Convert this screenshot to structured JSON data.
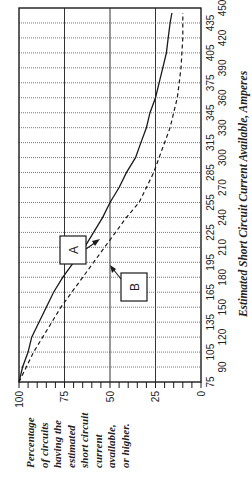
{
  "chart_data": {
    "type": "line",
    "title": "",
    "xlabel": "Estimated Short Circuit Current Available, Amperes",
    "ylabel": "Percentage of circuits having the estimated short circuit current available, or higher.",
    "ylabel_lines": [
      "Percentage",
      "of circuits",
      "having the",
      "estimated",
      "short circuit",
      "current",
      "available,",
      "or higher."
    ],
    "x": [
      75,
      90,
      105,
      120,
      135,
      150,
      165,
      180,
      195,
      210,
      225,
      240,
      255,
      270,
      285,
      300,
      315,
      330,
      345,
      360,
      375,
      390,
      405,
      420,
      435,
      445
    ],
    "xticks": [
      75,
      90,
      105,
      120,
      135,
      150,
      165,
      180,
      195,
      210,
      225,
      240,
      255,
      270,
      285,
      300,
      315,
      330,
      345,
      360,
      375,
      390,
      405,
      420,
      435,
      450
    ],
    "yticks": [
      100,
      75,
      50,
      25,
      0
    ],
    "xlim": [
      75,
      450
    ],
    "ylim": [
      0,
      100
    ],
    "grid": true,
    "orientation": "rotated 90 degrees counter-clockwise",
    "series": [
      {
        "name": "A",
        "style": "solid",
        "values": [
          100,
          98,
          95,
          93,
          89,
          85,
          81,
          76,
          70,
          64,
          59,
          54,
          50,
          45,
          41,
          36,
          33,
          30,
          28,
          25,
          23,
          21,
          19,
          18,
          17,
          16
        ]
      },
      {
        "name": "B",
        "style": "dashed",
        "values": [
          100,
          96,
          92,
          87,
          82,
          77,
          71,
          65,
          59,
          53,
          47,
          41,
          34,
          30,
          26,
          23,
          20,
          17,
          15,
          13,
          12,
          11,
          10.5,
          10,
          10,
          10
        ]
      }
    ],
    "annotations": [
      {
        "label": "A",
        "points_to_series": "A",
        "near_x": 225
      },
      {
        "label": "B",
        "points_to_series": "B",
        "near_x": 225
      }
    ]
  },
  "colors": {
    "line": "#1a1a1a",
    "grid": "#444444",
    "background": "#ffffff"
  }
}
